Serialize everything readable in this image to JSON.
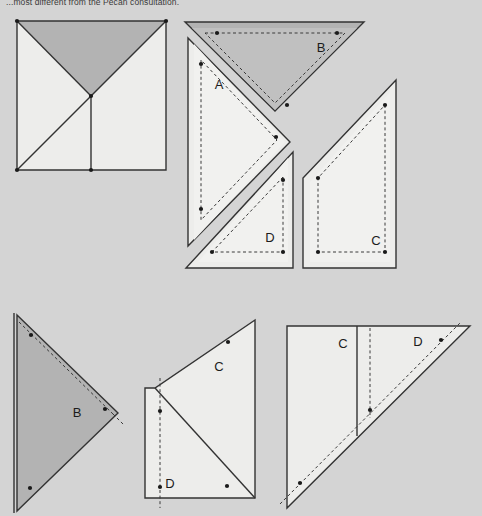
{
  "figure": {
    "caption": "...most different from the Pecan consultation.",
    "background_color": "#d4d4d4",
    "fill_light": "#ededeb",
    "fill_dark": "#b3b3b3",
    "stroke_color": "#333333",
    "dash_color": "#3a3a3a",
    "dot_color": "#1a1a1a"
  },
  "panels": {
    "panel_1": {
      "name": "assembled-square",
      "labels": []
    },
    "panel_2": {
      "name": "exploded-pieces",
      "labels": [
        {
          "text": "A",
          "x": 219,
          "y": 86
        },
        {
          "text": "B",
          "x": 321,
          "y": 49
        },
        {
          "text": "D",
          "x": 270,
          "y": 239
        },
        {
          "text": "C",
          "x": 376,
          "y": 242
        }
      ]
    },
    "panel_3": {
      "name": "piece-b-large",
      "labels": [
        {
          "text": "B",
          "x": 77,
          "y": 414
        }
      ]
    },
    "panel_4": {
      "name": "pieces-c-d-middle",
      "labels": [
        {
          "text": "C",
          "x": 219,
          "y": 368
        },
        {
          "text": "D",
          "x": 170,
          "y": 485
        }
      ]
    },
    "panel_5": {
      "name": "pieces-c-d-right",
      "labels": [
        {
          "text": "C",
          "x": 343,
          "y": 345
        },
        {
          "text": "D",
          "x": 418,
          "y": 343
        }
      ]
    }
  },
  "pieces": {
    "A": {
      "label": "A",
      "shading": "light"
    },
    "B": {
      "label": "B",
      "shading": "dark"
    },
    "C": {
      "label": "C",
      "shading": "light"
    },
    "D": {
      "label": "D",
      "shading": "light"
    }
  }
}
